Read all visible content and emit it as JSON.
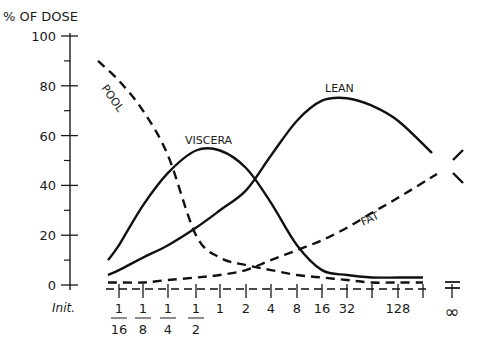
{
  "chart_data": {
    "type": "line",
    "title": "",
    "ylabel": "% OF DOSE",
    "xlabel": "",
    "ylim": [
      0,
      100
    ],
    "yticks": [
      0,
      20,
      40,
      60,
      80,
      100
    ],
    "grid": false,
    "legend": "inline labels on curves",
    "x_labels": [
      {
        "key": "init",
        "label": "Init.",
        "num": "",
        "den": ""
      },
      {
        "key": "1/16",
        "label": "",
        "num": "1",
        "den": "16"
      },
      {
        "key": "1/8",
        "label": "",
        "num": "1",
        "den": "8"
      },
      {
        "key": "1/4",
        "label": "",
        "num": "1",
        "den": "4"
      },
      {
        "key": "1/2",
        "label": "",
        "num": "1",
        "den": "2"
      },
      {
        "key": "1",
        "label": "1",
        "num": "",
        "den": ""
      },
      {
        "key": "2",
        "label": "2",
        "num": "",
        "den": ""
      },
      {
        "key": "4",
        "label": "4",
        "num": "",
        "den": ""
      },
      {
        "key": "8",
        "label": "8",
        "num": "",
        "den": ""
      },
      {
        "key": "16",
        "label": "16",
        "num": "",
        "den": ""
      },
      {
        "key": "32",
        "label": "32",
        "num": "",
        "den": ""
      },
      {
        "key": "64",
        "label": "",
        "num": "",
        "den": ""
      },
      {
        "key": "128",
        "label": "128",
        "num": "",
        "den": ""
      },
      {
        "key": "256",
        "label": "",
        "num": "",
        "den": ""
      },
      {
        "key": "inf",
        "label": "∞",
        "num": "",
        "den": ""
      }
    ],
    "categories": [
      "1/16",
      "1/8",
      "1/4",
      "1/2",
      "1",
      "2",
      "4",
      "8",
      "16",
      "32",
      "64",
      "128",
      "256",
      "∞"
    ],
    "series": [
      {
        "name": "POOL",
        "style": "dashed",
        "start": 90,
        "values": [
          82,
          70,
          52,
          20,
          11,
          8,
          6,
          4,
          3,
          2,
          1,
          1,
          1,
          null
        ]
      },
      {
        "name": "VISCERA",
        "style": "solid",
        "start": 10,
        "values": [
          16,
          32,
          45,
          54,
          54,
          47,
          33,
          16,
          6,
          4,
          3,
          3,
          3,
          null
        ]
      },
      {
        "name": "LEAN",
        "style": "solid",
        "start": 4,
        "values": [
          6,
          11,
          16,
          23,
          30,
          38,
          52,
          66,
          74,
          75,
          72,
          66,
          57,
          43
        ]
      },
      {
        "name": "FAT",
        "style": "dashed",
        "start": 1,
        "values": [
          1,
          1,
          2,
          3,
          4,
          6,
          10,
          14,
          18,
          23,
          29,
          35,
          42,
          53
        ]
      }
    ],
    "annotations": [
      "POOL",
      "VISCERA",
      "LEAN",
      "FAT"
    ]
  },
  "axis": {
    "y_title": "% OF DOSE",
    "y_tick_labels": [
      "0",
      "20",
      "40",
      "60",
      "80",
      "100"
    ],
    "init_label": "Init."
  },
  "labels": {
    "pool": "POOL",
    "viscera": "VISCERA",
    "lean": "LEAN",
    "fat": "FAT"
  }
}
